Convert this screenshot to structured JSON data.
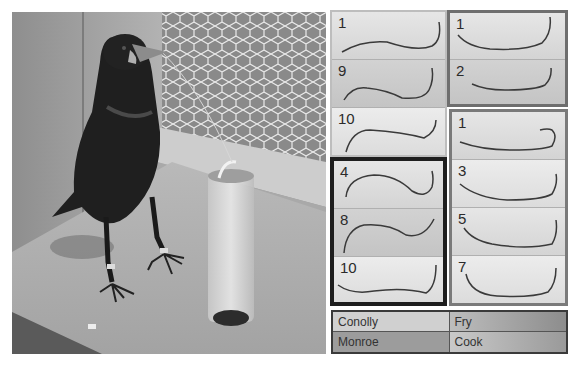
{
  "figure": {
    "photo": {
      "subject": "rook standing beside a clear vertical tube containing a small bucket with food",
      "description": "Bird on wooden platform, wire mesh background, hooked wire tool in tube"
    },
    "panels": [
      {
        "bird": "Conolly",
        "position": "top-left",
        "wires": [
          {
            "label": "1"
          },
          {
            "label": "9"
          },
          {
            "label": "10"
          }
        ]
      },
      {
        "bird": "Fry",
        "position": "top-right",
        "wires": [
          {
            "label": "1"
          },
          {
            "label": "2"
          }
        ]
      },
      {
        "bird": "Monroe",
        "position": "bottom-left",
        "wires": [
          {
            "label": "4"
          },
          {
            "label": "8"
          },
          {
            "label": "10"
          }
        ]
      },
      {
        "bird": "Cook",
        "position": "bottom-right",
        "wires": [
          {
            "label": "1"
          },
          {
            "label": "3"
          },
          {
            "label": "5"
          },
          {
            "label": "7"
          }
        ]
      }
    ],
    "legend": {
      "rows": [
        [
          "Conolly",
          "Fry"
        ],
        [
          "Monroe",
          "Cook"
        ]
      ]
    }
  }
}
